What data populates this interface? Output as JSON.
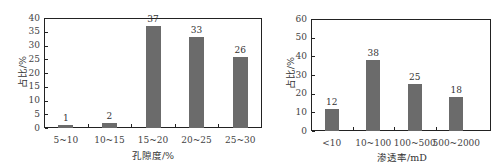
{
  "chart_data": [
    {
      "type": "bar",
      "title": "",
      "xlabel": "孔隙度/%",
      "ylabel": "占比/%",
      "categories": [
        "5~10",
        "10~15",
        "15~20",
        "20~25",
        "25~30"
      ],
      "values": [
        1,
        2,
        37,
        33,
        26
      ],
      "data_labels": [
        "1",
        "2",
        "37",
        "33",
        "26"
      ],
      "ylim": [
        0,
        40
      ],
      "yticks": [
        "0",
        "5",
        "10",
        "15",
        "20",
        "25",
        "30",
        "35",
        "40"
      ],
      "grid": false,
      "legend": null,
      "bar_color": "#6b6b6b"
    },
    {
      "type": "bar",
      "title": "",
      "xlabel": "渗透率/mD",
      "ylabel": "占比/%",
      "categories": [
        "<10",
        "10~100",
        "100~500",
        "500~2000"
      ],
      "values": [
        12,
        38,
        25,
        18
      ],
      "data_labels": [
        "12",
        "38",
        "25",
        "18"
      ],
      "ylim": [
        0,
        60
      ],
      "yticks": [
        "0",
        "10",
        "20",
        "30",
        "40",
        "50",
        "60"
      ],
      "grid": false,
      "legend": null,
      "bar_color": "#6b6b6b"
    }
  ]
}
